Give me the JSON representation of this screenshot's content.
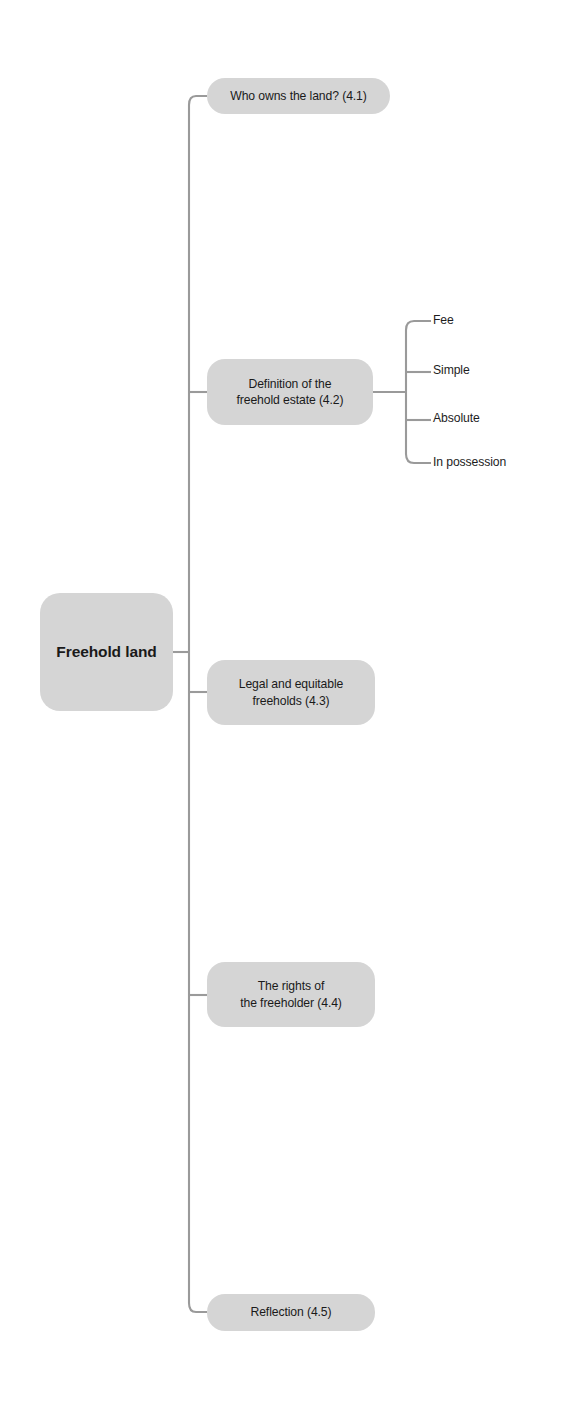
{
  "diagram": {
    "type": "mind-map",
    "title": "Freehold land",
    "root": {
      "label": "Freehold land"
    },
    "branches": [
      {
        "id": "4.1",
        "label": "Who owns the land? (4.1)"
      },
      {
        "id": "4.2",
        "label": "Definition of the\nfreehold estate (4.2)"
      },
      {
        "id": "4.3",
        "label": "Legal and equitable\nfreeholds (4.3)"
      },
      {
        "id": "4.4",
        "label": "The rights of\nthe freeholder (4.4)"
      },
      {
        "id": "4.5",
        "label": "Reflection (4.5)"
      }
    ],
    "sub_branches": [
      {
        "parent": "4.2",
        "label": "Fee"
      },
      {
        "parent": "4.2",
        "label": "Simple"
      },
      {
        "parent": "4.2",
        "label": "Absolute"
      },
      {
        "parent": "4.2",
        "label": "In possession"
      }
    ],
    "colors": {
      "node_fill": "#d5d5d5",
      "connector": "#9a9a9a",
      "text": "#1a1a1a",
      "background": "#ffffff"
    }
  }
}
